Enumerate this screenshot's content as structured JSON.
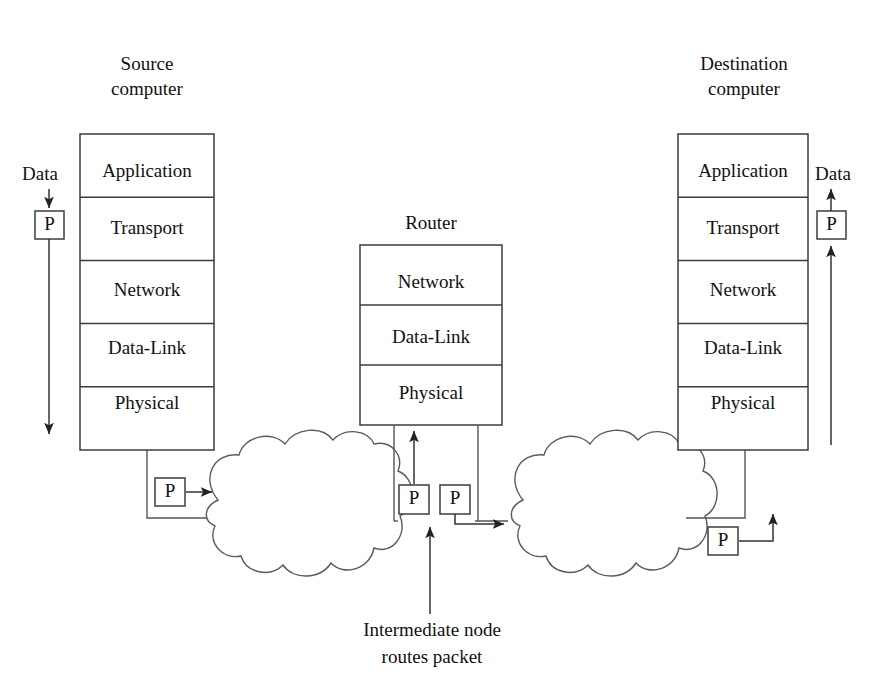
{
  "diagram": {
    "title_source": {
      "line1": "Source",
      "line2": "computer"
    },
    "title_router": "Router",
    "title_destination": {
      "line1": "Destination",
      "line2": "computer"
    },
    "caption": {
      "line1": "Intermediate node",
      "line2": "routes packet"
    },
    "data_label_left": "Data",
    "data_label_right": "Data",
    "packet_label": "P",
    "source_layers": [
      "Application",
      "Transport",
      "Network",
      "Data-Link",
      "Physical"
    ],
    "router_layers": [
      "Network",
      "Data-Link",
      "Physical"
    ],
    "destination_layers": [
      "Application",
      "Transport",
      "Network",
      "Data-Link",
      "Physical"
    ],
    "packets": [
      {
        "name": "source-top-packet",
        "label": "P"
      },
      {
        "name": "source-bottom-packet",
        "label": "P"
      },
      {
        "name": "router-in-packet",
        "label": "P"
      },
      {
        "name": "router-out-packet",
        "label": "P"
      },
      {
        "name": "destination-bottom-packet",
        "label": "P"
      },
      {
        "name": "destination-top-packet",
        "label": "P"
      }
    ],
    "colors": {
      "background": "#ffffff",
      "stroke": "#444444",
      "text": "#111111"
    }
  }
}
